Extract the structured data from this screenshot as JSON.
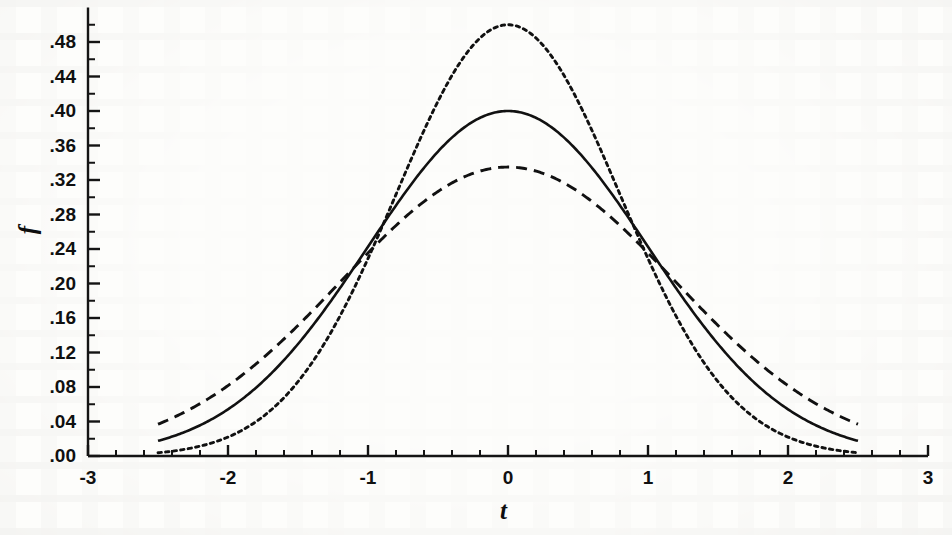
{
  "figure": {
    "axis_color": "#141414",
    "curve_color": "#111111",
    "background": "#fdfdfb"
  },
  "chart_data": {
    "type": "line",
    "title": "",
    "subtitle": "",
    "xlabel": "t",
    "ylabel": "f",
    "xlim": [
      -3,
      3
    ],
    "ylim": [
      0.0,
      0.52
    ],
    "grid": false,
    "legend": "none",
    "x_major_ticks": [
      -3,
      -2,
      -1,
      0,
      1,
      2,
      3
    ],
    "x_major_tick_labels": [
      "-3",
      "-2",
      "-1",
      "0",
      "1",
      "2",
      "3"
    ],
    "x_minor_tick_step": 0.2,
    "y_major_ticks": [
      0.0,
      0.04,
      0.08,
      0.12,
      0.16,
      0.2,
      0.24,
      0.28,
      0.32,
      0.36,
      0.4,
      0.44,
      0.48
    ],
    "y_major_tick_labels": [
      ".00",
      ".04",
      ".08",
      ".12",
      ".16",
      ".20",
      ".24",
      ".28",
      ".32",
      ".36",
      ".40",
      ".44",
      ".48"
    ],
    "y_minor_tick_step": 0.02,
    "x_domain_drawn": [
      -2.5,
      2.5
    ],
    "series": [
      {
        "name": "narrow-density",
        "style": "dotted",
        "peak_value": 0.5,
        "peak_at": 0.0,
        "sigma": 0.8,
        "x": [
          -2.5,
          -2.4,
          -2.3,
          -2.2,
          -2.1,
          -2.0,
          -1.9,
          -1.8,
          -1.7,
          -1.6,
          -1.5,
          -1.4,
          -1.3,
          -1.2,
          -1.1,
          -1.0,
          -0.9,
          -0.8,
          -0.7,
          -0.6,
          -0.5,
          -0.4,
          -0.3,
          -0.2,
          -0.1,
          0.0,
          0.1,
          0.2,
          0.3,
          0.4,
          0.5,
          0.6,
          0.7,
          0.8,
          0.9,
          1.0,
          1.1,
          1.2,
          1.3,
          1.4,
          1.5,
          1.6,
          1.7,
          1.8,
          1.9,
          2.0,
          2.1,
          2.2,
          2.3,
          2.4,
          2.5
        ],
        "y": [
          0.0029,
          0.0044,
          0.0065,
          0.0095,
          0.0136,
          0.0191,
          0.0264,
          0.0359,
          0.0478,
          0.0625,
          0.0802,
          0.1009,
          0.1245,
          0.1506,
          0.1786,
          0.2076,
          0.2366,
          0.2642,
          0.2893,
          0.3105,
          0.3268,
          0.3372,
          0.3413,
          0.3387,
          0.3297,
          0.3148,
          0.3297,
          0.3387,
          0.3413,
          0.3372,
          0.3268,
          0.3105,
          0.2893,
          0.2642,
          0.2366,
          0.2076,
          0.1786,
          0.1506,
          0.1245,
          0.1009,
          0.0802,
          0.0625,
          0.0478,
          0.0359,
          0.0264,
          0.0191,
          0.0136,
          0.0095,
          0.0065,
          0.0044,
          0.0029
        ]
      },
      {
        "name": "standard-normal-density",
        "style": "solid",
        "peak_value": 0.4,
        "peak_at": 0.0,
        "sigma": 1.0,
        "x": [
          -2.5,
          -2.0,
          -1.5,
          -1.0,
          -0.5,
          0.0,
          0.5,
          1.0,
          1.5,
          2.0,
          2.5
        ],
        "y": [
          0.0175,
          0.054,
          0.1295,
          0.242,
          0.3521,
          0.3989,
          0.3521,
          0.242,
          0.1295,
          0.054,
          0.0175
        ]
      },
      {
        "name": "wide-density",
        "style": "dashed",
        "peak_value": 0.335,
        "peak_at": 0.0,
        "sigma": 1.19,
        "x": [
          -2.5,
          -2.0,
          -1.5,
          -1.0,
          -0.5,
          0.0,
          0.5,
          1.0,
          1.5,
          2.0,
          2.5
        ],
        "y": [
          0.0405,
          0.0837,
          0.1445,
          0.211,
          0.281,
          0.3352,
          0.281,
          0.211,
          0.1445,
          0.0837,
          0.0405
        ]
      }
    ],
    "crossover_points": [
      {
        "t": -1.0,
        "f": 0.238
      },
      {
        "t": 1.0,
        "f": 0.238
      }
    ]
  }
}
